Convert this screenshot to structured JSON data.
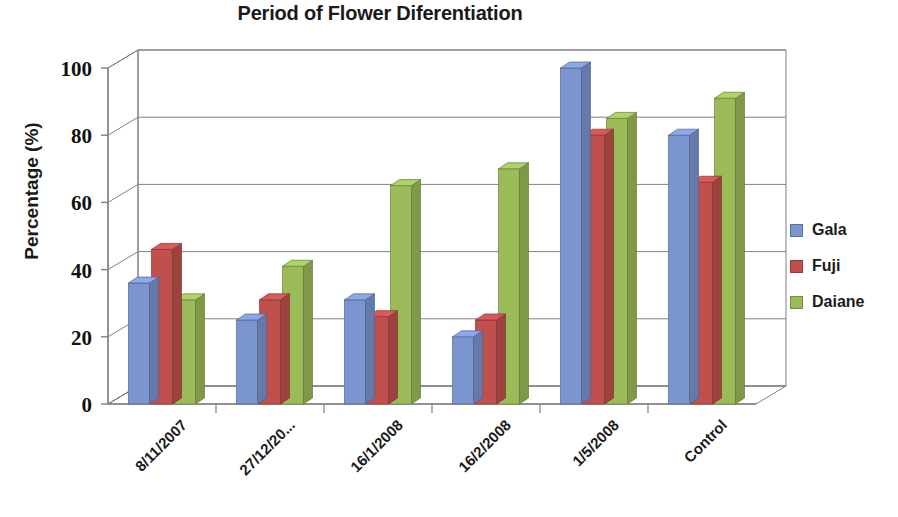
{
  "chart_data": {
    "type": "bar",
    "title": "Period of Flower Diferentiation",
    "xlabel": "",
    "ylabel": "Percentage (%)",
    "ylim": [
      0,
      100
    ],
    "yticks": [
      0,
      20,
      40,
      60,
      80,
      100
    ],
    "ytick_labels": [
      "0",
      "20",
      "40",
      "60",
      "80",
      "100"
    ],
    "grid": true,
    "legend_position": "right",
    "style": "3d-clustered-column",
    "categories": [
      "8/11/2007",
      "27/12/20...",
      "16/1/2008",
      "16/2/2008",
      "1/5/2008",
      "Control"
    ],
    "series": [
      {
        "name": "Gala",
        "color": "#7b95d1",
        "values": [
          36,
          25,
          31,
          20,
          100,
          80
        ]
      },
      {
        "name": "Fuji",
        "color": "#c0504d",
        "values": [
          46,
          31,
          26,
          25,
          80,
          66
        ]
      },
      {
        "name": "Daiane",
        "color": "#9bbb59",
        "values": [
          31,
          41,
          65,
          70,
          85,
          91
        ]
      }
    ]
  },
  "legend": {
    "items": [
      {
        "label": "Gala",
        "color": "#7b95d1"
      },
      {
        "label": "Fuji",
        "color": "#c0504d"
      },
      {
        "label": "Daiane",
        "color": "#9bbb59"
      }
    ]
  }
}
